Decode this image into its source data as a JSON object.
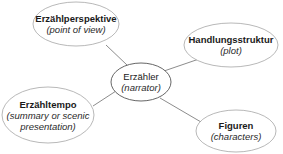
{
  "diagram": {
    "type": "mind-map",
    "colors": {
      "ellipse_stroke": "#8c8c8c",
      "ellipse_fill": "#ffffff",
      "center_stroke": "#555555",
      "line": "#6e6e6e",
      "text": "#1a1a1a"
    },
    "center": {
      "title": "Erzähler",
      "subtitle": "(narrator)"
    },
    "nodes": [
      {
        "id": "perspective",
        "title": "Erzählperspektive",
        "subtitle": "(point of view)"
      },
      {
        "id": "plot",
        "title": "Handlungsstruktur",
        "subtitle": "(plot)"
      },
      {
        "id": "tempo",
        "title": "Erzähltempo",
        "subtitle": "(summary or scenic",
        "subtitle2": "presentation)"
      },
      {
        "id": "characters",
        "title": "Figuren",
        "subtitle": "(characters)"
      }
    ]
  }
}
